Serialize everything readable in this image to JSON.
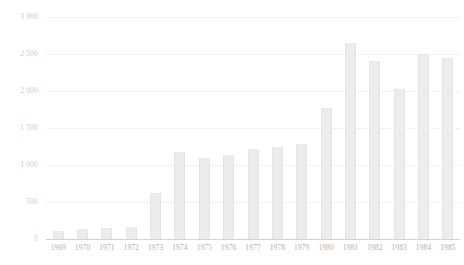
{
  "chart_data": {
    "type": "bar",
    "title": "",
    "subtitle": "",
    "xlabel": "",
    "ylabel": "",
    "ylim": [
      0,
      3000
    ],
    "grid": true,
    "legend": false,
    "legend_position": "none",
    "categories": [
      "1969",
      "1970",
      "1971",
      "1972",
      "1973",
      "1974",
      "1975",
      "1976",
      "1977",
      "1978",
      "1979",
      "1980",
      "1981",
      "1982",
      "1983",
      "1984",
      "1985"
    ],
    "values": [
      110,
      130,
      150,
      165,
      620,
      1175,
      1095,
      1140,
      1220,
      1245,
      1290,
      1770,
      2650,
      2400,
      2030,
      2500,
      2450
    ],
    "ytick_labels": [
      "3 000",
      "2 500",
      "2 000",
      "1 500",
      "1 000",
      "500",
      "0"
    ],
    "ytick_values": [
      3000,
      2500,
      2000,
      1500,
      1000,
      500,
      0
    ],
    "colors": {
      "bar_fill": "#ececec",
      "bar_edge": "#e4e4e4",
      "gridline": "#f2f2f2",
      "axis": "#d2d2d2",
      "tick_text": "#b0b0b0",
      "background": "#ffffff"
    }
  }
}
